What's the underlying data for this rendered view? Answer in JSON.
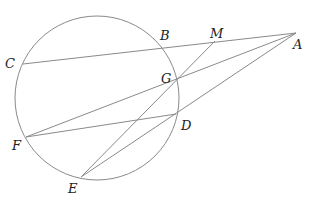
{
  "diagram": {
    "type": "geometry",
    "circle": {
      "label": "circle"
    },
    "points": {
      "A": "A",
      "B": "B",
      "C": "C",
      "D": "D",
      "E": "E",
      "F": "F",
      "G": "G",
      "M": "M"
    },
    "segments": [
      "CA",
      "FA",
      "EA",
      "ME",
      "FD"
    ],
    "colors": {
      "line": "#8a8a8a",
      "label": "#222222"
    }
  }
}
